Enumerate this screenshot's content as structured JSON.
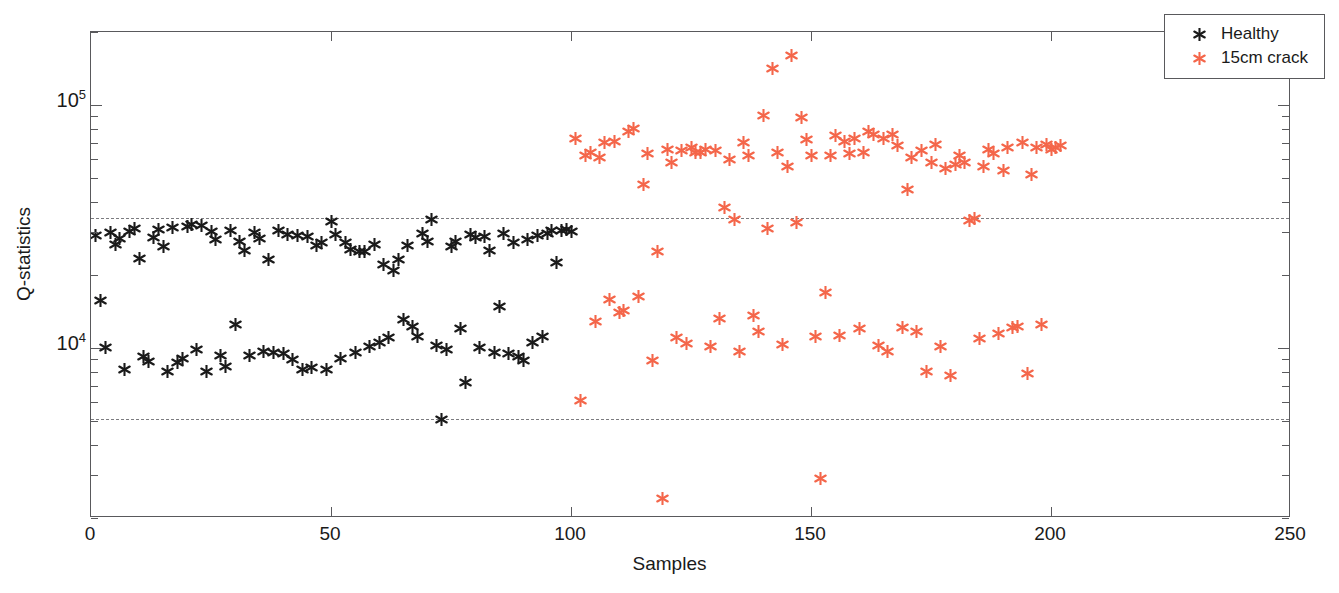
{
  "chart_data": {
    "type": "scatter",
    "title": "",
    "xlabel": "Samples",
    "ylabel": "Q-statistics",
    "yscale": "log",
    "xlim": [
      0,
      250
    ],
    "ylim": [
      2000,
      200000
    ],
    "grid": false,
    "legend_position": "top-right",
    "xticks": [
      0,
      50,
      100,
      150,
      200,
      250
    ],
    "xtick_labels": [
      "0",
      "50",
      "100",
      "150",
      "200",
      "250"
    ],
    "yticks": [
      10000,
      100000
    ],
    "ytick_labels": [
      "10",
      "10"
    ],
    "ytick_exponents": [
      "4",
      "5"
    ],
    "annotations": [
      {
        "name": "upper-control-limit",
        "type": "hline",
        "y": 34500,
        "style": "dashed",
        "color": "#7c7c80"
      },
      {
        "name": "lower-control-limit",
        "type": "hline",
        "y": 5100,
        "style": "dashed",
        "color": "#7c7c80"
      }
    ],
    "series": [
      {
        "name": "Healthy",
        "color": "#1a1a1a",
        "marker": "asterisk",
        "points": [
          [
            1,
            29000
          ],
          [
            2,
            15700
          ],
          [
            3,
            10100
          ],
          [
            4,
            30000
          ],
          [
            5,
            26800
          ],
          [
            6,
            28300
          ],
          [
            7,
            8200
          ],
          [
            8,
            30100
          ],
          [
            9,
            31000
          ],
          [
            10,
            23300
          ],
          [
            11,
            9200
          ],
          [
            12,
            8800
          ],
          [
            13,
            28600
          ],
          [
            14,
            30900
          ],
          [
            15,
            26100
          ],
          [
            16,
            8000
          ],
          [
            17,
            31400
          ],
          [
            18,
            8700
          ],
          [
            19,
            9100
          ],
          [
            20,
            31800
          ],
          [
            21,
            32400
          ],
          [
            22,
            9900
          ],
          [
            23,
            32100
          ],
          [
            24,
            8000
          ],
          [
            25,
            30100
          ],
          [
            26,
            28000
          ],
          [
            27,
            9300
          ],
          [
            28,
            8400
          ],
          [
            29,
            30600
          ],
          [
            30,
            12500
          ],
          [
            31,
            27400
          ],
          [
            32,
            25300
          ],
          [
            33,
            9300
          ],
          [
            34,
            30000
          ],
          [
            35,
            28400
          ],
          [
            36,
            9700
          ],
          [
            37,
            23100
          ],
          [
            38,
            9600
          ],
          [
            39,
            30600
          ],
          [
            40,
            9500
          ],
          [
            41,
            29300
          ],
          [
            42,
            9000
          ],
          [
            43,
            29000
          ],
          [
            44,
            8200
          ],
          [
            45,
            28700
          ],
          [
            46,
            8300
          ],
          [
            47,
            26500
          ],
          [
            48,
            27100
          ],
          [
            49,
            8200
          ],
          [
            50,
            33300
          ],
          [
            51,
            29400
          ],
          [
            52,
            9100
          ],
          [
            53,
            27200
          ],
          [
            54,
            25500
          ],
          [
            55,
            9600
          ],
          [
            56,
            25100
          ],
          [
            57,
            24900
          ],
          [
            58,
            10200
          ],
          [
            59,
            26800
          ],
          [
            60,
            10600
          ],
          [
            61,
            22000
          ],
          [
            62,
            11100
          ],
          [
            63,
            20800
          ],
          [
            64,
            23200
          ],
          [
            65,
            13100
          ],
          [
            66,
            26500
          ],
          [
            67,
            12300
          ],
          [
            68,
            11200
          ],
          [
            69,
            29600
          ],
          [
            70,
            27600
          ],
          [
            71,
            33900
          ],
          [
            72,
            10300
          ],
          [
            73,
            5100
          ],
          [
            74,
            9900
          ],
          [
            75,
            26300
          ],
          [
            76,
            27600
          ],
          [
            77,
            12000
          ],
          [
            78,
            7200
          ],
          [
            79,
            29500
          ],
          [
            80,
            28500
          ],
          [
            81,
            10100
          ],
          [
            82,
            28900
          ],
          [
            83,
            25200
          ],
          [
            84,
            9600
          ],
          [
            85,
            14800
          ],
          [
            86,
            29600
          ],
          [
            87,
            9500
          ],
          [
            88,
            27300
          ],
          [
            89,
            9200
          ],
          [
            90,
            8900
          ],
          [
            91,
            28000
          ],
          [
            92,
            10600
          ],
          [
            93,
            29200
          ],
          [
            94,
            11200
          ],
          [
            95,
            29700
          ],
          [
            96,
            30600
          ],
          [
            97,
            22600
          ],
          [
            98,
            30400
          ],
          [
            99,
            30800
          ],
          [
            100,
            30200
          ]
        ]
      },
      {
        "name": "15cm crack",
        "color": "#f4664a",
        "marker": "asterisk",
        "points": [
          [
            101,
            73000
          ],
          [
            102,
            6100
          ],
          [
            103,
            62000
          ],
          [
            104,
            64000
          ],
          [
            105,
            12900
          ],
          [
            106,
            61000
          ],
          [
            107,
            70000
          ],
          [
            108,
            15900
          ],
          [
            109,
            71000
          ],
          [
            110,
            14000
          ],
          [
            111,
            14300
          ],
          [
            112,
            78000
          ],
          [
            113,
            80000
          ],
          [
            114,
            16300
          ],
          [
            115,
            47000
          ],
          [
            116,
            63000
          ],
          [
            117,
            8900
          ],
          [
            118,
            25000
          ],
          [
            119,
            2400
          ],
          [
            120,
            66000
          ],
          [
            121,
            58000
          ],
          [
            122,
            11100
          ],
          [
            123,
            65000
          ],
          [
            124,
            10500
          ],
          [
            125,
            67000
          ],
          [
            126,
            64000
          ],
          [
            127,
            64000
          ],
          [
            128,
            66000
          ],
          [
            129,
            10200
          ],
          [
            130,
            65000
          ],
          [
            131,
            13200
          ],
          [
            132,
            38000
          ],
          [
            133,
            60000
          ],
          [
            134,
            34000
          ],
          [
            135,
            9700
          ],
          [
            136,
            70000
          ],
          [
            137,
            62000
          ],
          [
            138,
            13600
          ],
          [
            139,
            11700
          ],
          [
            140,
            91000
          ],
          [
            141,
            31000
          ],
          [
            142,
            141000
          ],
          [
            143,
            64000
          ],
          [
            144,
            10400
          ],
          [
            145,
            56000
          ],
          [
            146,
            160000
          ],
          [
            147,
            33000
          ],
          [
            148,
            89000
          ],
          [
            149,
            72000
          ],
          [
            150,
            62000
          ],
          [
            151,
            11200
          ],
          [
            152,
            2900
          ],
          [
            153,
            17000
          ],
          [
            154,
            62000
          ],
          [
            155,
            75000
          ],
          [
            156,
            11300
          ],
          [
            157,
            71000
          ],
          [
            158,
            63000
          ],
          [
            159,
            73000
          ],
          [
            160,
            12100
          ],
          [
            161,
            64000
          ],
          [
            162,
            78000
          ],
          [
            163,
            76000
          ],
          [
            164,
            10300
          ],
          [
            165,
            73000
          ],
          [
            166,
            9700
          ],
          [
            167,
            76000
          ],
          [
            168,
            68000
          ],
          [
            169,
            12200
          ],
          [
            170,
            45000
          ],
          [
            171,
            61000
          ],
          [
            172,
            11700
          ],
          [
            173,
            65000
          ],
          [
            174,
            8000
          ],
          [
            175,
            58000
          ],
          [
            176,
            69000
          ],
          [
            177,
            10200
          ],
          [
            178,
            55000
          ],
          [
            179,
            7700
          ],
          [
            180,
            57000
          ],
          [
            181,
            62000
          ],
          [
            182,
            58000
          ],
          [
            183,
            33600
          ],
          [
            184,
            34200
          ],
          [
            185,
            11000
          ],
          [
            186,
            56000
          ],
          [
            187,
            66000
          ],
          [
            188,
            63000
          ],
          [
            189,
            11500
          ],
          [
            190,
            54000
          ],
          [
            191,
            67000
          ],
          [
            192,
            12200
          ],
          [
            193,
            12300
          ],
          [
            194,
            70000
          ],
          [
            195,
            7900
          ],
          [
            196,
            52000
          ],
          [
            197,
            67000
          ],
          [
            198,
            12500
          ],
          [
            199,
            69000
          ],
          [
            200,
            66000
          ],
          [
            201,
            67000
          ],
          [
            202,
            68000
          ]
        ]
      }
    ]
  },
  "legend": {
    "entries": [
      {
        "label": "Healthy",
        "color": "#1a1a1a"
      },
      {
        "label": "15cm crack",
        "color": "#f4664a"
      }
    ]
  },
  "axes": {
    "x_title": "Samples",
    "y_title": "Q-statistics"
  }
}
